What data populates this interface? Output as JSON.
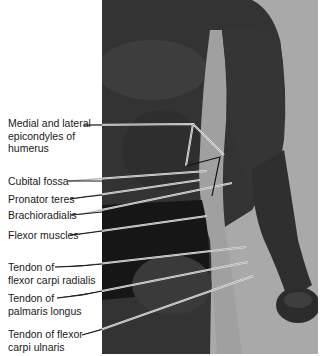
{
  "figure": {
    "colors": {
      "background": "#ffffff",
      "photo_backdrop": "#a9a9a9",
      "skin_dark": "#2a2a2a",
      "leader_line": "#e8e8e8",
      "label_text": "#1a1a1a"
    },
    "labels": [
      {
        "id": "epicondyles",
        "lines": [
          "Medial and lateral",
          "epicondyles of",
          "humerus"
        ]
      },
      {
        "id": "cubital-fossa",
        "lines": [
          "Cubital fossa"
        ]
      },
      {
        "id": "pronator-teres",
        "lines": [
          "Pronator teres"
        ]
      },
      {
        "id": "brachioradialis",
        "lines": [
          "Brachioradialis"
        ]
      },
      {
        "id": "flexor-muscles",
        "lines": [
          "Flexor muscles"
        ]
      },
      {
        "id": "fcr-tendon",
        "lines": [
          "Tendon of",
          "flexor carpi radialis"
        ]
      },
      {
        "id": "pl-tendon",
        "lines": [
          "Tendon of",
          "palmaris longus"
        ]
      },
      {
        "id": "fcu-tendon",
        "lines": [
          "Tendon of flexor",
          "carpi ulnaris"
        ]
      }
    ]
  }
}
